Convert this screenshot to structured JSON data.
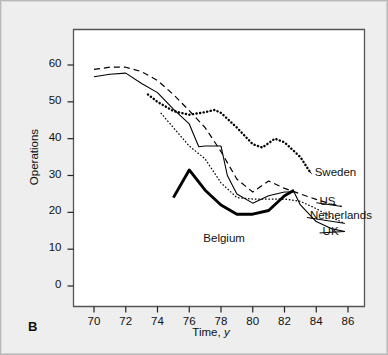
{
  "figure": {
    "panel_letter": "B",
    "background_color": "#eeeeee",
    "plot_background_color": "#ffffff",
    "frame_color": "#555555"
  },
  "chart_data": {
    "type": "line",
    "title": "",
    "xlabel": "Time, y",
    "ylabel": "Operations",
    "xlim": [
      69.0,
      87.0
    ],
    "ylim": [
      0,
      65
    ],
    "xticks": [
      70,
      72,
      74,
      76,
      78,
      80,
      82,
      84,
      86
    ],
    "xtick_labels": [
      "70",
      "72",
      "74",
      "76",
      "78",
      "80",
      "82",
      "84",
      "86"
    ],
    "yticks": [
      0,
      10,
      20,
      30,
      40,
      50,
      60
    ],
    "ytick_labels": [
      "0",
      "10",
      "20",
      "30",
      "40",
      "50",
      "60"
    ],
    "grid": false,
    "legend_position": "inline-right-of-curve-ends",
    "series": [
      {
        "name": "Sweden",
        "style": "dotted-thick",
        "color": "#000000",
        "label": "Sweden",
        "label_x": 83.9,
        "label_y": 30.5,
        "x": [
          73.4,
          74.0,
          75.0,
          76.0,
          77.0,
          77.6,
          78.0,
          79.0,
          80.0,
          80.6,
          81.4,
          82.0,
          83.0,
          83.6
        ],
        "y": [
          52.0,
          50.0,
          47.5,
          46.5,
          47.2,
          47.8,
          47.0,
          43.0,
          38.5,
          37.6,
          40.0,
          39.0,
          35.0,
          31.0
        ]
      },
      {
        "name": "US",
        "style": "dashed",
        "color": "#000000",
        "label": "US",
        "label_x": 84.2,
        "label_y": 22.6,
        "x": [
          70.0,
          71.0,
          72.0,
          73.0,
          74.0,
          75.0,
          76.0,
          77.0,
          78.0,
          79.0,
          80.0,
          81.0,
          82.0,
          83.0,
          84.0,
          85.0,
          85.6
        ],
        "y": [
          58.8,
          59.4,
          59.4,
          58.2,
          55.8,
          52.0,
          47.6,
          43.0,
          36.5,
          29.0,
          25.5,
          28.5,
          26.5,
          25.0,
          23.5,
          22.2,
          21.6
        ]
      },
      {
        "name": "Netherlands",
        "style": "fine-dotted",
        "color": "#000000",
        "label": "Netherlands",
        "label_x": 83.6,
        "label_y": 18.6,
        "x": [
          74.2,
          75.0,
          76.0,
          77.0,
          78.0,
          79.0,
          80.0,
          81.0,
          82.0,
          83.0,
          84.0,
          85.0,
          85.8
        ],
        "y": [
          47.0,
          43.0,
          38.0,
          34.5,
          28.0,
          24.0,
          23.6,
          23.6,
          23.6,
          23.0,
          21.0,
          18.5,
          17.0
        ]
      },
      {
        "name": "UK",
        "style": "solid-thin",
        "color": "#000000",
        "label": "UK",
        "label_x": 84.4,
        "label_y": 14.4,
        "x": [
          70.0,
          71.0,
          72.0,
          73.0,
          74.0,
          75.0,
          76.0,
          76.6,
          77.0,
          78.0,
          78.4,
          79.0,
          80.0,
          81.0,
          82.0,
          82.6,
          83.0,
          84.0,
          85.0,
          85.8
        ],
        "y": [
          56.8,
          57.5,
          57.8,
          55.0,
          52.5,
          48.0,
          44.0,
          37.8,
          38.0,
          38.0,
          30.0,
          25.0,
          22.5,
          24.5,
          25.5,
          25.5,
          22.0,
          17.5,
          15.5,
          14.8
        ]
      },
      {
        "name": "Belgium",
        "style": "solid-thick",
        "color": "#000000",
        "label": "Belgium",
        "label_x": 78.4,
        "label_y": 12.4,
        "x": [
          75.0,
          76.0,
          77.0,
          78.0,
          79.0,
          80.0,
          81.0,
          82.0,
          82.6
        ],
        "y": [
          24.0,
          31.5,
          26.0,
          22.0,
          19.5,
          19.5,
          20.5,
          24.5,
          26.0
        ]
      }
    ]
  }
}
